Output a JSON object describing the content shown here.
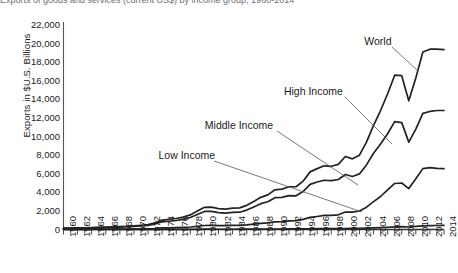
{
  "figure": {
    "cropped_header": "Exports of goods and services (current US$) by income group, 1960-2014",
    "axis_title_y": "Exports in  $U.S. Billions"
  },
  "chart_data": {
    "type": "line",
    "title": "",
    "xlabel": "",
    "ylabel": "Exports in  $U.S. Billions",
    "ylim": [
      0,
      22000
    ],
    "ytick_labels": [
      "22,000",
      "20,000",
      "18,000",
      "16,000",
      "14,000",
      "12,000",
      "10,000",
      "8,000",
      "6,000",
      "4,000",
      "2,000",
      "0"
    ],
    "ytick_values": [
      22000,
      20000,
      18000,
      16000,
      14000,
      12000,
      10000,
      8000,
      6000,
      4000,
      2000,
      0
    ],
    "grid": false,
    "legend_position": "inline-annotations",
    "xlim": [
      1960,
      2014
    ],
    "xtick_labels": [
      "1960",
      "1962",
      "1964",
      "1966",
      "1968",
      "1970",
      "1972",
      "1974",
      "1976",
      "1978",
      "1980",
      "1982",
      "1984",
      "1986",
      "1988",
      "1990",
      "1992",
      "1994",
      "1996",
      "1998",
      "2000",
      "2002",
      "2004",
      "2006",
      "2008",
      "2010",
      "2012",
      "2014"
    ],
    "x": [
      1960,
      1961,
      1962,
      1963,
      1964,
      1965,
      1966,
      1967,
      1968,
      1969,
      1970,
      1971,
      1972,
      1973,
      1974,
      1975,
      1976,
      1977,
      1978,
      1979,
      1980,
      1981,
      1982,
      1983,
      1984,
      1985,
      1986,
      1987,
      1988,
      1989,
      1990,
      1991,
      1992,
      1993,
      1994,
      1995,
      1996,
      1997,
      1998,
      1999,
      2000,
      2001,
      2002,
      2003,
      2004,
      2005,
      2006,
      2007,
      2008,
      2009,
      2010,
      2011,
      2012,
      2013,
      2014
    ],
    "series": [
      {
        "name": "World",
        "color": "#222222",
        "values": [
          140,
          150,
          165,
          180,
          200,
          225,
          250,
          275,
          305,
          350,
          400,
          445,
          530,
          715,
          1010,
          1080,
          1185,
          1330,
          1570,
          1980,
          2390,
          2410,
          2250,
          2200,
          2300,
          2330,
          2600,
          3020,
          3460,
          3720,
          4270,
          4340,
          4600,
          4600,
          5200,
          6200,
          6550,
          6850,
          6800,
          7000,
          7850,
          7600,
          8000,
          9400,
          11200,
          12800,
          14600,
          16600,
          16550,
          13850,
          16300,
          19100,
          19400,
          19400,
          19350
        ]
      },
      {
        "name": "High Income",
        "color": "#222222",
        "values": [
          120,
          130,
          142,
          155,
          172,
          192,
          213,
          234,
          260,
          298,
          340,
          378,
          450,
          600,
          830,
          885,
          970,
          1090,
          1290,
          1620,
          1940,
          1950,
          1820,
          1770,
          1840,
          1860,
          2090,
          2430,
          2780,
          2980,
          3420,
          3460,
          3650,
          3620,
          4080,
          4860,
          5110,
          5300,
          5250,
          5380,
          5920,
          5700,
          5980,
          6950,
          8200,
          9200,
          10300,
          11600,
          11500,
          9400,
          10800,
          12500,
          12700,
          12800,
          12800
        ]
      },
      {
        "name": "Middle Income",
        "color": "#222222",
        "values": [
          18,
          19,
          21,
          23,
          26,
          30,
          34,
          38,
          42,
          48,
          55,
          62,
          75,
          108,
          170,
          185,
          205,
          230,
          270,
          345,
          430,
          440,
          415,
          410,
          440,
          450,
          490,
          570,
          660,
          720,
          820,
          850,
          930,
          960,
          1090,
          1300,
          1400,
          1510,
          1510,
          1580,
          1880,
          1860,
          1990,
          2400,
          3000,
          3550,
          4250,
          4950,
          5000,
          4400,
          5450,
          6550,
          6650,
          6580,
          6540
        ]
      },
      {
        "name": "Low Income",
        "color": "#222222",
        "values": [
          2,
          2,
          2,
          3,
          3,
          3,
          4,
          4,
          4,
          5,
          5,
          6,
          7,
          9,
          14,
          15,
          16,
          18,
          20,
          25,
          30,
          31,
          29,
          28,
          29,
          30,
          32,
          37,
          42,
          46,
          52,
          54,
          58,
          60,
          68,
          80,
          86,
          92,
          92,
          95,
          110,
          112,
          120,
          140,
          175,
          205,
          240,
          280,
          300,
          270,
          330,
          400,
          420,
          430,
          440
        ]
      }
    ],
    "annotations": [
      {
        "label": "World",
        "x": 2006,
        "y": 20600
      },
      {
        "label": "High Income",
        "x": 1999,
        "y": 12400
      },
      {
        "label": "Middle Income",
        "x": 1988,
        "y": 7900
      },
      {
        "label": "Low Income",
        "x": 1981,
        "y": 5200
      }
    ]
  }
}
